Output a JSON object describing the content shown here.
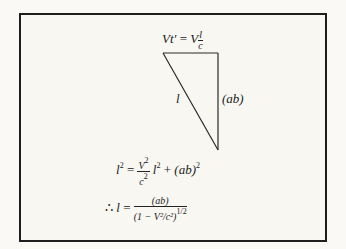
{
  "diagram": {
    "top_label": {
      "lhs": "Vt′",
      "eq": "=",
      "coef": "V",
      "frac_num": "l",
      "frac_den": "c"
    },
    "hypotenuse_label": "l",
    "side_label": "(ab)",
    "equation1": {
      "lhs": "l",
      "lhs_exp": "2",
      "eq": "=",
      "frac_num": "V",
      "frac_num_exp": "2",
      "frac_den": "c",
      "frac_den_exp": "2",
      "term": "l",
      "term_exp": "2",
      "plus": "+",
      "ab": "(ab)",
      "ab_exp": "2"
    },
    "equation2": {
      "therefore": "∴",
      "lhs": "l",
      "eq": "=",
      "num": "(ab)",
      "den": "(1 − V²/c²)",
      "den_exp": "1/2"
    },
    "colors": {
      "line": "#2a2a2a",
      "background": "#f8f7f2",
      "border": "#1e1e1e"
    }
  }
}
